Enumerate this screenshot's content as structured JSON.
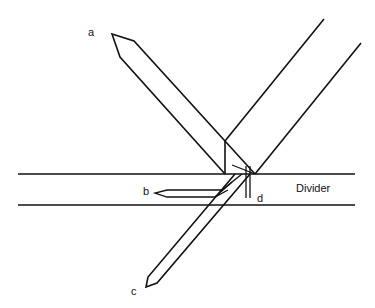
{
  "diagram": {
    "type": "beam-splitter-path-diagram",
    "labels": {
      "a": "a",
      "b": "b",
      "c": "c",
      "d": "d",
      "divider": "Divider"
    },
    "colors": {
      "line": "#111111",
      "background": "#ffffff"
    },
    "elements": [
      {
        "id": "a",
        "description": "arrow pointing up-left from junction"
      },
      {
        "id": "b",
        "description": "arrow pointing left inside divider"
      },
      {
        "id": "c",
        "description": "arrow pointing down-left below divider"
      },
      {
        "id": "d",
        "description": "short vertical lines at junction within divider"
      },
      {
        "id": "divider",
        "description": "horizontal band between two parallel lines"
      },
      {
        "id": "incoming-beam",
        "description": "two parallel lines from upper right"
      }
    ]
  }
}
